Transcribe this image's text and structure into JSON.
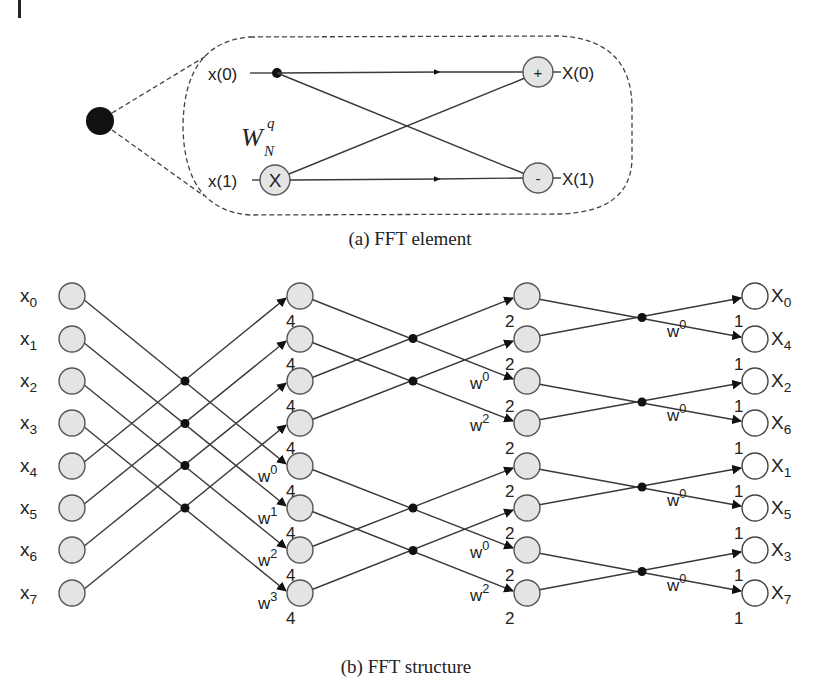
{
  "figure": {
    "part_a": {
      "caption": "(a) FFT element",
      "inputs": [
        "x(0)",
        "x(1)"
      ],
      "outputs": [
        "X(0)",
        "X(1)"
      ],
      "multiplier_symbol": "X",
      "adder_symbol": "+",
      "subtractor_symbol": "-",
      "twiddle": {
        "base": "W",
        "subscript": "N",
        "superscript": "q"
      }
    },
    "part_b": {
      "caption": "(b) FFT structure",
      "inputs": [
        {
          "base": "x",
          "sub": "0"
        },
        {
          "base": "x",
          "sub": "1"
        },
        {
          "base": "x",
          "sub": "2"
        },
        {
          "base": "x",
          "sub": "3"
        },
        {
          "base": "x",
          "sub": "4"
        },
        {
          "base": "x",
          "sub": "5"
        },
        {
          "base": "x",
          "sub": "6"
        },
        {
          "base": "x",
          "sub": "7"
        }
      ],
      "outputs": [
        {
          "base": "X",
          "sub": "0"
        },
        {
          "base": "X",
          "sub": "4"
        },
        {
          "base": "X",
          "sub": "2"
        },
        {
          "base": "X",
          "sub": "6"
        },
        {
          "base": "X",
          "sub": "1"
        },
        {
          "base": "X",
          "sub": "5"
        },
        {
          "base": "X",
          "sub": "3"
        },
        {
          "base": "X",
          "sub": "7"
        }
      ],
      "stage1": {
        "node_labels": [
          "4",
          "4",
          "4",
          "4",
          "4",
          "4",
          "4",
          "4"
        ],
        "twiddles": [
          {
            "row": 4,
            "base": "w",
            "exp": "0"
          },
          {
            "row": 5,
            "base": "w",
            "exp": "1"
          },
          {
            "row": 6,
            "base": "w",
            "exp": "2"
          },
          {
            "row": 7,
            "base": "w",
            "exp": "3"
          }
        ]
      },
      "stage2": {
        "node_labels": [
          "2",
          "2",
          "2",
          "2",
          "2",
          "2",
          "2",
          "2"
        ],
        "twiddles": [
          {
            "row": 2,
            "base": "w",
            "exp": "0"
          },
          {
            "row": 3,
            "base": "w",
            "exp": "2"
          },
          {
            "row": 6,
            "base": "w",
            "exp": "0"
          },
          {
            "row": 7,
            "base": "w",
            "exp": "2"
          }
        ]
      },
      "stage3": {
        "node_labels": [
          "1",
          "1",
          "1",
          "1",
          "1",
          "1",
          "1",
          "1"
        ],
        "twiddles": [
          {
            "row": 1,
            "base": "w",
            "exp": "0"
          },
          {
            "row": 3,
            "base": "w",
            "exp": "0"
          },
          {
            "row": 5,
            "base": "w",
            "exp": "0"
          },
          {
            "row": 7,
            "base": "w",
            "exp": "0"
          }
        ]
      }
    }
  }
}
